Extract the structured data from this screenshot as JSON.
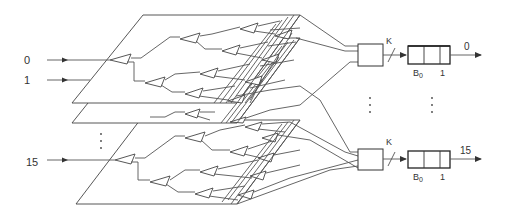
{
  "diagram": {
    "inputs": {
      "labels": [
        "0",
        "1",
        "15"
      ],
      "ellipsis": "⋮"
    },
    "planes": {
      "count_shown": 3,
      "element": "binary-tree-splitter"
    },
    "outputs": [
      {
        "concentrator_label": "K",
        "buffer_label_left": "B",
        "buffer_label_sub": "0",
        "buffer_label_right": "1",
        "output_label": "0"
      },
      {
        "concentrator_label": "K",
        "buffer_label_left": "B",
        "buffer_label_sub": "0",
        "buffer_label_right": "1",
        "output_label": "15"
      }
    ],
    "colors": {
      "line": "#555555",
      "text": "#333333",
      "background": "#ffffff"
    }
  }
}
